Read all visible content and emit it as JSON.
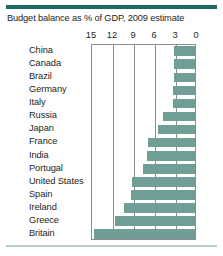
{
  "chart_data": {
    "type": "bar",
    "title": "Budget balance as % of GDP, 2009 estimate",
    "xlabel": "",
    "ylabel": "",
    "orientation": "horizontal",
    "axis_reversed": true,
    "xlim": [
      15,
      0
    ],
    "ticks": [
      15,
      12,
      9,
      6,
      3,
      0
    ],
    "grid": true,
    "legend": "none",
    "categories": [
      "China",
      "Canada",
      "Brazil",
      "Germany",
      "Italy",
      "Russia",
      "Japan",
      "France",
      "India",
      "Portugal",
      "United States",
      "Spain",
      "Ireland",
      "Greece",
      "Britain"
    ],
    "values": [
      3.0,
      3.0,
      3.0,
      3.1,
      3.2,
      4.6,
      5.3,
      6.7,
      6.8,
      7.5,
      9.0,
      9.2,
      10.1,
      11.4,
      14.4
    ],
    "bar_color": "#6f9e96",
    "frame_color": "#8d8d8d",
    "rule_color": "#1d6b62",
    "bottom_rule_color": "#b9cfcb",
    "text_color": "#231f20"
  }
}
